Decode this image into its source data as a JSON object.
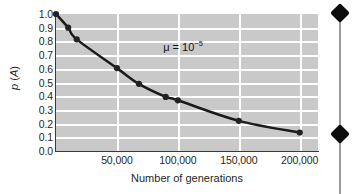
{
  "figure": {
    "plot_bg_color": "#c9c9c9",
    "grid_color": "#ffffff",
    "curve_color": "#1a1a1a",
    "marker_color": "#222222",
    "axis_color": "#3a3a3a",
    "annotation": {
      "symbol": "μ",
      "equals": " = ",
      "base": "10",
      "exponent": "−5",
      "full_text": "μ = 10−5"
    }
  },
  "chart_data": {
    "type": "line",
    "title": "",
    "subtitle": "",
    "xlabel": "Number of generations",
    "ylabel": "p (A)",
    "ylabel_parts": {
      "italic_p": "p",
      "paren_open": " (",
      "italic_a": "A",
      "paren_close": ")"
    },
    "xlim": [
      0,
      215000
    ],
    "ylim": [
      0.0,
      1.0
    ],
    "grid": true,
    "legend": "none",
    "xticks": [
      50000,
      100000,
      150000,
      200000
    ],
    "xticklabels": [
      "50,000",
      "100,000",
      "150,000",
      "200,000"
    ],
    "yticks": [
      0.0,
      0.1,
      0.2,
      0.3,
      0.4,
      0.5,
      0.6,
      0.7,
      0.8,
      0.9,
      1.0
    ],
    "yticklabels": [
      "0.0",
      "0.1",
      "0.2",
      "0.3",
      "0.4",
      "0.5",
      "0.6",
      "0.7",
      "0.8",
      "0.9",
      "1.0"
    ],
    "annotations": [
      {
        "text": "μ = 10−5",
        "x": 88000,
        "y": 0.76
      }
    ],
    "series": [
      {
        "name": "p(A) decay",
        "x": [
          0,
          10000,
          17000,
          50000,
          68000,
          90000,
          100000,
          150000,
          200000
        ],
        "values": [
          1.0,
          0.9,
          0.815,
          0.605,
          0.49,
          0.395,
          0.37,
          0.22,
          0.135
        ],
        "marker": "circle",
        "line_style": "solid"
      }
    ]
  },
  "axes": {
    "y_tick_labels": [
      "1.0",
      "0.9",
      "0.8",
      "0.7",
      "0.6",
      "0.5",
      "0.4",
      "0.3",
      "0.2",
      "0.1",
      "0.0"
    ],
    "x_tick_labels": [
      "50,000",
      "100,000",
      "150,000",
      "200,000"
    ],
    "x_title": "Number of generations",
    "y_title_p": "p",
    "y_title_a": "A"
  },
  "overlay": {
    "name": "selection-handles",
    "handle_count": 2,
    "line_color": "#9a9a9a",
    "handle_color": "#0d0d0d"
  }
}
